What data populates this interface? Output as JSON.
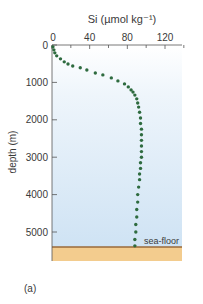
{
  "chart_data": {
    "type": "scatter",
    "title": "",
    "xlabel": "Si (µmol kg⁻¹)",
    "ylabel": "depth (m)",
    "x_ticks": [
      "0",
      "40",
      "80",
      "120"
    ],
    "y_ticks": [
      "0",
      "1000",
      "2000",
      "3000",
      "4000",
      "5000"
    ],
    "xlim": [
      0,
      140
    ],
    "ylim": [
      5800,
      0
    ],
    "x_axis_position": "top",
    "y_inverted": true,
    "grid": false,
    "legend": null,
    "annotations": [
      {
        "text": "sea-floor",
        "depth": 5350
      }
    ],
    "panel_label": "(a)",
    "series": [
      {
        "name": "Si profile",
        "color": "#2e6b3f",
        "points": [
          {
            "si": 1,
            "depth": 50
          },
          {
            "si": 2,
            "depth": 130
          },
          {
            "si": 3,
            "depth": 210
          },
          {
            "si": 5,
            "depth": 290
          },
          {
            "si": 9,
            "depth": 370
          },
          {
            "si": 13,
            "depth": 450
          },
          {
            "si": 17,
            "depth": 510
          },
          {
            "si": 22,
            "depth": 560
          },
          {
            "si": 30,
            "depth": 610
          },
          {
            "si": 37,
            "depth": 670
          },
          {
            "si": 46,
            "depth": 750
          },
          {
            "si": 54,
            "depth": 800
          },
          {
            "si": 63,
            "depth": 880
          },
          {
            "si": 70,
            "depth": 960
          },
          {
            "si": 77,
            "depth": 1040
          },
          {
            "si": 81,
            "depth": 1120
          },
          {
            "si": 84,
            "depth": 1200
          },
          {
            "si": 86,
            "depth": 1260
          },
          {
            "si": 88,
            "depth": 1340
          },
          {
            "si": 90,
            "depth": 1440
          },
          {
            "si": 91,
            "depth": 1550
          },
          {
            "si": 92,
            "depth": 1660
          },
          {
            "si": 93,
            "depth": 1800
          },
          {
            "si": 94,
            "depth": 1950
          },
          {
            "si": 94,
            "depth": 2100
          },
          {
            "si": 95,
            "depth": 2250
          },
          {
            "si": 95,
            "depth": 2400
          },
          {
            "si": 95,
            "depth": 2550
          },
          {
            "si": 95,
            "depth": 2700
          },
          {
            "si": 95,
            "depth": 2850
          },
          {
            "si": 95,
            "depth": 3000
          },
          {
            "si": 94,
            "depth": 3150
          },
          {
            "si": 94,
            "depth": 3300
          },
          {
            "si": 93,
            "depth": 3450
          },
          {
            "si": 93,
            "depth": 3600
          },
          {
            "si": 92,
            "depth": 3800
          },
          {
            "si": 91,
            "depth": 4000
          },
          {
            "si": 91,
            "depth": 4200
          },
          {
            "si": 90,
            "depth": 4400
          },
          {
            "si": 90,
            "depth": 4600
          },
          {
            "si": 89,
            "depth": 4800
          },
          {
            "si": 89,
            "depth": 5000
          },
          {
            "si": 88,
            "depth": 5200
          },
          {
            "si": 88,
            "depth": 5370
          }
        ]
      }
    ]
  },
  "colors": {
    "water_top": "#ffffff",
    "water_bottom": "#cfe3f4",
    "sea_floor_line": "#9a6a3a",
    "sediment": "#f3cc8e",
    "dots": "#2e6b3f",
    "axis": "#555555"
  }
}
